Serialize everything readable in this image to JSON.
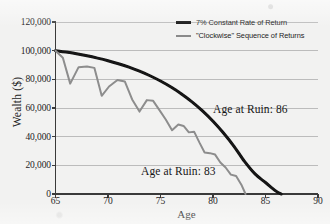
{
  "chart_data": {
    "type": "line",
    "title": "",
    "xlabel": "Age",
    "ylabel": "Wealth ($)",
    "xlim": [
      65,
      90
    ],
    "ylim": [
      0,
      120000
    ],
    "grid": "horizontal",
    "legend_position": "top-right-inside",
    "xticks": [
      "65",
      "70",
      "75",
      "80",
      "85",
      "90"
    ],
    "xtick_values": [
      65,
      70,
      75,
      80,
      85,
      90
    ],
    "yticks": [
      "0",
      "20,000",
      "40,000",
      "60,000",
      "80,000",
      "100,000",
      "120,000"
    ],
    "ytick_values": [
      0,
      20000,
      40000,
      60000,
      80000,
      100000,
      120000
    ],
    "series": [
      {
        "name": "7% Constant Rate of Return",
        "color": "#121212",
        "style": "smooth-thick",
        "x": [
          65,
          66,
          67,
          68,
          69,
          70,
          71,
          72,
          73,
          74,
          75,
          76,
          77,
          78,
          79,
          80,
          81,
          82,
          83,
          84,
          85,
          86,
          86.5
        ],
        "values": [
          100000,
          99000,
          97800,
          96400,
          94800,
          93000,
          90900,
          88500,
          85700,
          82500,
          78800,
          74600,
          69800,
          64300,
          58000,
          50800,
          42600,
          33300,
          22700,
          14000,
          8000,
          2000,
          0
        ]
      },
      {
        "name": "\"Clockwise\" Sequence of Returns",
        "color": "#8d8d8d",
        "style": "zigzag",
        "x": [
          65,
          65.7,
          66.4,
          67.2,
          68.0,
          68.7,
          69.4,
          70.1,
          70.9,
          71.6,
          72.3,
          73.0,
          73.7,
          74.3,
          74.9,
          75.5,
          76.1,
          76.7,
          77.2,
          77.7,
          78.2,
          78.7,
          79.2,
          79.7,
          80.2,
          80.7,
          81.2,
          81.7,
          82.2,
          82.7,
          83.1
        ],
        "values": [
          100000,
          95000,
          77000,
          88500,
          89000,
          88000,
          68500,
          75000,
          79500,
          78500,
          66000,
          57500,
          65500,
          65000,
          58500,
          52000,
          44500,
          48500,
          47500,
          43000,
          43500,
          36000,
          29000,
          28500,
          27500,
          22000,
          18500,
          13500,
          12500,
          6500,
          0
        ]
      }
    ],
    "annotations": [
      {
        "text": "Age at Ruin: 86",
        "series": "7% Constant Rate of Return"
      },
      {
        "text": "Age at Ruin: 83",
        "series": "\"Clockwise\" Sequence of Returns"
      }
    ]
  },
  "legend": {
    "items": [
      {
        "label": "7% Constant Rate of Return",
        "color": "#121212"
      },
      {
        "label": "\"Clockwise\" Sequence of Returns",
        "color": "#8d8d8d"
      }
    ]
  },
  "axes": {
    "x_title": "Age",
    "y_title": "Wealth ($)"
  },
  "annotations": {
    "constant": "Age at Ruin: 86",
    "clockwise": "Age at Ruin: 83"
  }
}
